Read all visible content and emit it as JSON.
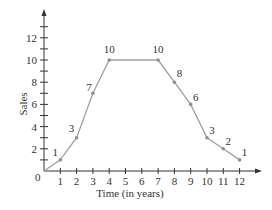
{
  "chart_data": {
    "type": "line",
    "title": "",
    "xlabel": "Time (in years)",
    "ylabel": "Sales",
    "x": [
      0,
      1,
      2,
      3,
      4,
      5,
      6,
      7,
      8,
      9,
      10,
      11,
      12
    ],
    "series": [
      {
        "name": "Sales",
        "x": [
          0,
          1,
          2,
          3,
          4,
          7,
          8,
          9,
          10,
          11,
          12
        ],
        "values": [
          0,
          1,
          3,
          7,
          10,
          10,
          8,
          6,
          3,
          2,
          1
        ]
      }
    ],
    "point_labels": [
      {
        "x": 1,
        "y": 1,
        "label": "1"
      },
      {
        "x": 2,
        "y": 3,
        "label": "3"
      },
      {
        "x": 3,
        "y": 7,
        "label": "7"
      },
      {
        "x": 4,
        "y": 10,
        "label": "10"
      },
      {
        "x": 7,
        "y": 10,
        "label": "10"
      },
      {
        "x": 8,
        "y": 8,
        "label": "8"
      },
      {
        "x": 9,
        "y": 6,
        "label": "6"
      },
      {
        "x": 10,
        "y": 3,
        "label": "3"
      },
      {
        "x": 11,
        "y": 2,
        "label": "2"
      },
      {
        "x": 12,
        "y": 1,
        "label": "1"
      }
    ],
    "xticks": [
      "1",
      "2",
      "3",
      "4",
      "5",
      "6",
      "7",
      "8",
      "9",
      "10",
      "11",
      "12"
    ],
    "yticks": [
      "2",
      "4",
      "6",
      "8",
      "10",
      "12"
    ],
    "origin_label": "0",
    "xlim": [
      0,
      13
    ],
    "ylim": [
      0,
      14
    ],
    "grid": false,
    "legend": "none",
    "line_color": "#a0a0a0",
    "marker_color": "#909090",
    "axis_color": "#333333"
  }
}
